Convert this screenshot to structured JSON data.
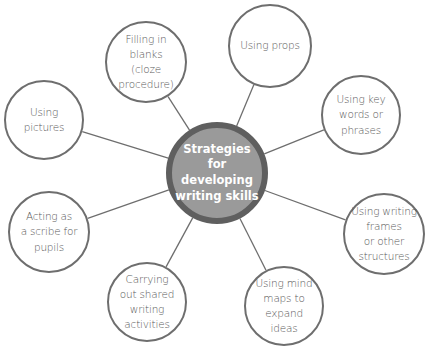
{
  "diagram": {
    "type": "mind-map",
    "colors": {
      "center_fill": "#9a9a9a",
      "center_border": "#5f5f5f",
      "node_border": "#6e6e6e",
      "line": "#6e6e6e",
      "text": "#5a5a5a"
    },
    "center": {
      "label": "Strategies\nfor\ndeveloping\nwriting skills",
      "cx": 217,
      "cy": 173,
      "r": 51
    },
    "nodes": [
      {
        "id": "filling-in-blanks",
        "label": "Filling in\nblanks (cloze\nprocedure)",
        "cx": 146,
        "cy": 62,
        "r": 41
      },
      {
        "id": "using-props",
        "label": "Using props",
        "cx": 270,
        "cy": 46,
        "r": 42
      },
      {
        "id": "using-key-words",
        "label": "Using key\nwords or\nphrases",
        "cx": 361,
        "cy": 115,
        "r": 40
      },
      {
        "id": "using-writing-frames",
        "label": "Using writing\nframes\nor other\nstructures",
        "cx": 384,
        "cy": 234,
        "r": 41
      },
      {
        "id": "using-mind-maps",
        "label": "Using mind\nmaps to\nexpand ideas",
        "cx": 284,
        "cy": 306,
        "r": 40
      },
      {
        "id": "carrying-out-shared-writing",
        "label": "Carrying\nout shared\nwriting\nactivities",
        "cx": 147,
        "cy": 302,
        "r": 40
      },
      {
        "id": "acting-as-scribe",
        "label": "Acting as\na scribe for\npupils",
        "cx": 49,
        "cy": 232,
        "r": 41
      },
      {
        "id": "using-pictures",
        "label": "Using\npictures",
        "cx": 44,
        "cy": 120,
        "r": 40
      }
    ]
  }
}
